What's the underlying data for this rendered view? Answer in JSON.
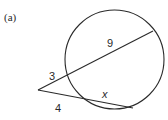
{
  "figure": {
    "part_label": "(a)",
    "labels": {
      "upper_external": "3",
      "upper_internal": "9",
      "lower_external": "4",
      "lower_internal": "x"
    },
    "colors": {
      "stroke": "#2a2a2a",
      "background": "#ffffff"
    }
  }
}
